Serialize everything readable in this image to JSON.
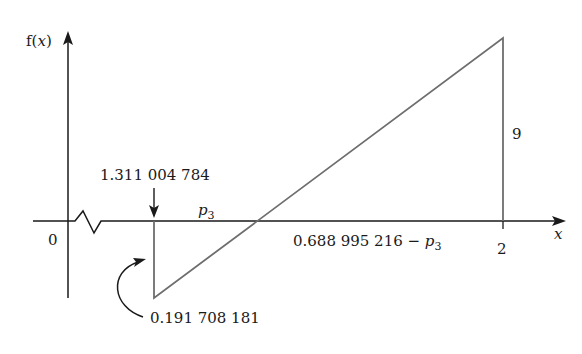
{
  "diagram": {
    "type": "piecewise-linear function sketch",
    "axes": {
      "y_label_prefix": "f(",
      "y_label_var": "x",
      "y_label_suffix": ")",
      "x_label": "x",
      "origin_label": "0",
      "x_tick_label": "2",
      "axis_break": "zigzag between 0 and 1.311 004 784"
    },
    "annotations": {
      "left_point_label": "1.311 004 784",
      "bottom_value_label": "0.191 708 181",
      "height_label": "9",
      "p3_symbol": "p",
      "p3_subscript": "3",
      "right_segment_prefix": "0.688 995 216 − ",
      "right_segment_symbol": "p",
      "right_segment_subscript": "3"
    },
    "colors": {
      "axis": "#1a1a1a",
      "function_line": "#6e6e6e",
      "text": "#1a1a1a"
    }
  }
}
